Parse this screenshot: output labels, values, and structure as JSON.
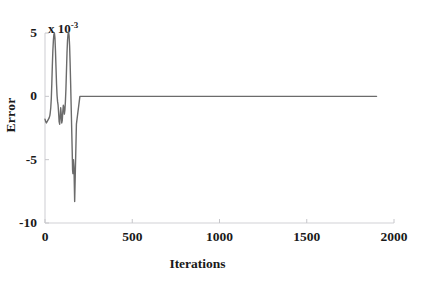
{
  "figure": {
    "background_color": "#ffffff",
    "scan_artifact_text": "·  · ·   ··     ·· ·   ·"
  },
  "chart_data": {
    "type": "line",
    "title": "",
    "subtitle": "",
    "xlabel": "Iterations",
    "ylabel": "Error",
    "y_multiplier_text": "x 10",
    "y_multiplier_exponent": "-3",
    "y_multiplier": 0.001,
    "xlim": [
      0,
      2000
    ],
    "ylim": [
      -10,
      5
    ],
    "xticks": [
      0,
      500,
      1000,
      1500,
      2000
    ],
    "xticklabels": [
      "0",
      "500",
      "1000",
      "1500",
      "2000"
    ],
    "yticks": [
      5,
      0,
      -5,
      -10
    ],
    "yticklabels": [
      "5",
      "0",
      "-5",
      "-10"
    ],
    "grid": false,
    "legend": null,
    "legend_position": "none",
    "line_color": "#6b6b6b",
    "line_width": 1.4,
    "axis_color": "#d2d2d6",
    "series": [
      {
        "name": "Error",
        "units": "x 10^-3",
        "x": [
          0,
          4,
          8,
          12,
          16,
          20,
          24,
          28,
          30,
          33,
          36,
          39,
          42,
          45,
          48,
          51,
          54,
          57,
          60,
          63,
          66,
          69,
          72,
          75,
          78,
          81,
          84,
          87,
          90,
          93,
          96,
          99,
          102,
          105,
          108,
          111,
          114,
          117,
          120,
          123,
          126,
          129,
          132,
          135,
          138,
          141,
          144,
          147,
          150,
          153,
          156,
          158,
          160,
          163,
          166,
          170,
          180,
          200,
          300,
          500,
          800,
          1100,
          1400,
          1700,
          1900
        ],
        "y": [
          -1.8,
          -2.0,
          -2.1,
          -2.0,
          -1.9,
          -1.8,
          -1.7,
          -1.5,
          -1.3,
          -0.9,
          -0.2,
          1.0,
          2.4,
          3.6,
          4.4,
          4.9,
          5.0,
          4.6,
          3.6,
          2.3,
          1.0,
          0.1,
          -0.4,
          -0.7,
          -1.3,
          -2.0,
          -2.2,
          -1.6,
          -0.9,
          -1.4,
          -2.1,
          -1.9,
          -1.2,
          -0.7,
          -0.9,
          -1.4,
          -1.1,
          -0.4,
          0.6,
          2.0,
          3.4,
          4.4,
          4.9,
          5.1,
          4.8,
          4.0,
          2.6,
          1.0,
          -0.8,
          -2.6,
          -4.4,
          -5.8,
          -6.1,
          -5.0,
          -5.6,
          -8.3,
          -2.2,
          0.0,
          0.0,
          0.0,
          0.0,
          0.0,
          0.0,
          0.0,
          0.0
        ]
      }
    ],
    "annotations": [
      {
        "text": "transient oscillation then convergence to zero",
        "x_range": [
          0,
          170
        ]
      }
    ],
    "data_end_x": 1900
  }
}
